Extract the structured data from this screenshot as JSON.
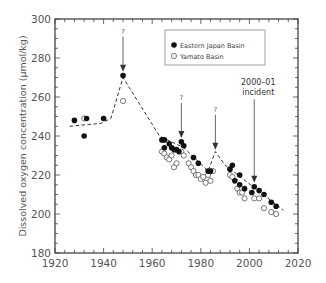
{
  "chart_data": {
    "type": "scatter",
    "title": "",
    "xlabel": "",
    "ylabel": "Dissolved oxygen concentration (µmol/kg)",
    "xlim": [
      1920,
      2020
    ],
    "ylim": [
      180,
      300
    ],
    "xticks": [
      1920,
      1940,
      1960,
      1980,
      2000,
      2020
    ],
    "yticks": [
      180,
      200,
      220,
      240,
      260,
      280,
      300
    ],
    "grid": false,
    "legend": {
      "placement": "top-right",
      "entries": [
        "Eastern Japan Basin",
        "Yamato Basin"
      ]
    },
    "series": [
      {
        "name": "Eastern Japan Basin",
        "marker": "filled-circle",
        "x": [
          1928,
          1932,
          1933,
          1940,
          1948,
          1964,
          1965,
          1965,
          1967,
          1968,
          1969,
          1970,
          1971,
          1972,
          1973,
          1977,
          1979,
          1983,
          1984,
          1992,
          1993,
          1994,
          1996,
          1996,
          1998,
          2001,
          2002,
          2004,
          2006,
          2009,
          2011
        ],
        "y": [
          248,
          240,
          249,
          249,
          271,
          238,
          238,
          234,
          236,
          234,
          233,
          233,
          232,
          237,
          235,
          229,
          226,
          222,
          222,
          223,
          225,
          217,
          220,
          215,
          213,
          211,
          214,
          212,
          210,
          206,
          204
        ]
      },
      {
        "name": "Yamato Basin",
        "marker": "open-circle",
        "x": [
          1932,
          1948,
          1964,
          1965,
          1966,
          1967,
          1968,
          1969,
          1970,
          1972,
          1973,
          1975,
          1976,
          1977,
          1978,
          1979,
          1980,
          1981,
          1982,
          1983,
          1984,
          1985,
          1992,
          1993,
          1995,
          1996,
          1997,
          1998,
          2002,
          2004,
          2006,
          2009,
          2011
        ],
        "y": [
          249,
          258,
          232,
          231,
          229,
          228,
          230,
          224,
          226,
          232,
          230,
          226,
          224,
          222,
          220,
          220,
          218,
          219,
          216,
          220,
          217,
          222,
          220,
          219,
          213,
          211,
          211,
          208,
          208,
          208,
          203,
          201,
          200
        ]
      },
      {
        "name": "trend",
        "marker": "dashed-line",
        "x": [
          1926,
          1939,
          1943,
          1948,
          1963,
          1973,
          1983,
          1986,
          1990,
          2014
        ],
        "y": [
          245,
          246.5,
          249,
          270,
          240,
          234,
          222,
          232,
          225,
          202
        ]
      }
    ],
    "annotations": [
      {
        "text": "?",
        "x": 1948,
        "arrow_to_y": 273
      },
      {
        "text": "?",
        "x": 1972,
        "arrow_to_y": 239
      },
      {
        "text": "?",
        "x": 1986,
        "arrow_to_y": 233
      },
      {
        "text": "2000–01",
        "text2": "incident",
        "x": 2002,
        "arrow_to_y": 216
      }
    ]
  }
}
